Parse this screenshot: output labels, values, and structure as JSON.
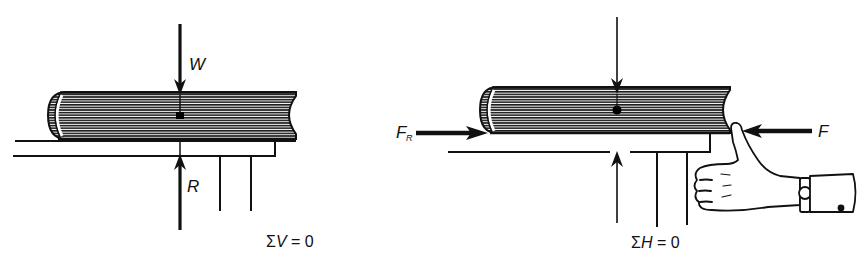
{
  "figure": {
    "panels": [
      {
        "id": "left",
        "description": "Book resting on table: vertical equilibrium",
        "labels": {
          "weight": "W",
          "reaction": "R"
        },
        "equation": {
          "sigma": "Σ",
          "var": "V",
          "rest": " = 0"
        }
      },
      {
        "id": "right",
        "description": "Book pushed by thumb against friction: horizontal equilibrium",
        "labels": {
          "friction_main": "F",
          "friction_sub": "R",
          "push": "F"
        },
        "equation": {
          "sigma": "Σ",
          "var": "H",
          "rest": " = 0"
        }
      }
    ],
    "colors": {
      "ink": "#111111",
      "paper": "#ffffff"
    }
  }
}
